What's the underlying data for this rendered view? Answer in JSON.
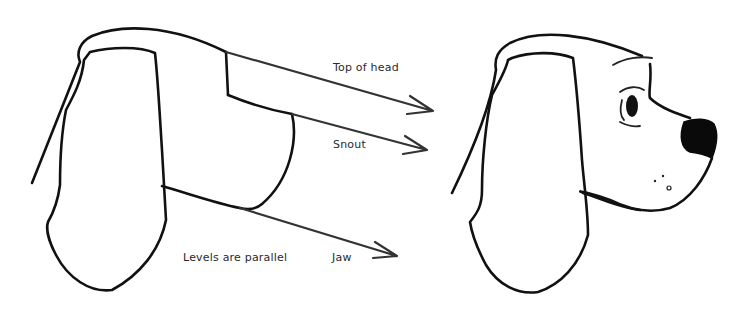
{
  "diagram": {
    "labels": {
      "top_of_head": "Top of head",
      "snout": "Snout",
      "jaw": "Jaw",
      "levels_note": "Levels are parallel"
    },
    "colors": {
      "ink": "#111111",
      "arrow": "#333333",
      "text": "#2a2a2a",
      "background": "#ffffff"
    },
    "figures": [
      {
        "name": "construction-block-head",
        "description": "Boxy construction sketch of dog head with ear"
      },
      {
        "name": "finished-dog-head",
        "description": "Finished cartoon dog head in profile with long ear, eye, black nose"
      }
    ],
    "arrows": [
      "top-of-head-arrow",
      "snout-arrow",
      "jaw-arrow"
    ]
  }
}
